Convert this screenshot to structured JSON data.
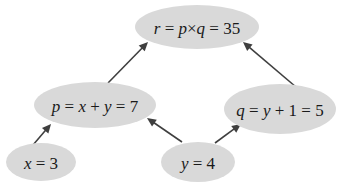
{
  "diagram": {
    "type": "computation-graph",
    "colors": {
      "node_fill": "#d9d9d9",
      "edge": "#3f3f3f",
      "text": "#1a1a1a",
      "background": "#ffffff"
    },
    "nodes": [
      {
        "id": "r",
        "label": "r = p×q = 35",
        "parts": [
          {
            "t": "r",
            "italic": true
          },
          {
            "t": " = ",
            "italic": false
          },
          {
            "t": "p",
            "italic": true
          },
          {
            "t": "×",
            "italic": false
          },
          {
            "t": "q",
            "italic": true
          },
          {
            "t": " = 35",
            "italic": false
          }
        ],
        "cx": 197,
        "cy": 27,
        "rx": 62,
        "ry": 22
      },
      {
        "id": "p",
        "label": "p = x + y = 7",
        "parts": [
          {
            "t": "p",
            "italic": true
          },
          {
            "t": " = ",
            "italic": false
          },
          {
            "t": "x",
            "italic": true
          },
          {
            "t": " + ",
            "italic": false
          },
          {
            "t": "y",
            "italic": true
          },
          {
            "t": " = 7",
            "italic": false
          }
        ],
        "cx": 95,
        "cy": 105,
        "rx": 61,
        "ry": 23
      },
      {
        "id": "q",
        "label": "q = y + 1 = 5",
        "parts": [
          {
            "t": "q",
            "italic": true
          },
          {
            "t": " = ",
            "italic": false
          },
          {
            "t": "y",
            "italic": true
          },
          {
            "t": " + 1 = 5",
            "italic": false
          }
        ],
        "cx": 280,
        "cy": 109,
        "rx": 56,
        "ry": 25
      },
      {
        "id": "x",
        "label": "x = 3",
        "parts": [
          {
            "t": "x",
            "italic": true
          },
          {
            "t": " = 3",
            "italic": false
          }
        ],
        "cx": 41,
        "cy": 162,
        "rx": 35,
        "ry": 19
      },
      {
        "id": "y",
        "label": "y = 4",
        "parts": [
          {
            "t": "y",
            "italic": true
          },
          {
            "t": " = 4",
            "italic": false
          }
        ],
        "cx": 198,
        "cy": 162,
        "rx": 37,
        "ry": 20
      }
    ],
    "edges": [
      {
        "from": "p",
        "to": "r",
        "x1": 108,
        "y1": 83,
        "x2": 148,
        "y2": 42
      },
      {
        "from": "q",
        "to": "r",
        "x1": 296,
        "y1": 87,
        "x2": 243,
        "y2": 42
      },
      {
        "from": "x",
        "to": "p",
        "x1": 33,
        "y1": 145,
        "x2": 51,
        "y2": 124
      },
      {
        "from": "y",
        "to": "p",
        "x1": 182,
        "y1": 142,
        "x2": 147,
        "y2": 118
      },
      {
        "from": "y",
        "to": "q",
        "x1": 215,
        "y1": 143,
        "x2": 241,
        "y2": 124
      }
    ]
  }
}
